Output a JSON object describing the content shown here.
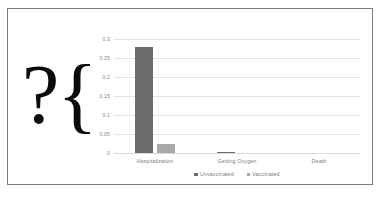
{
  "slide": {
    "glyph": "?{",
    "border_color": "#7c7c7c",
    "background": "#ffffff"
  },
  "chart_data": {
    "type": "bar",
    "title": "",
    "xlabel": "",
    "ylabel": "",
    "categories": [
      "Hospitalization",
      "Getting Oxygen",
      "Death"
    ],
    "series": [
      {
        "name": "Unvaccinated",
        "color": "#6b6b6b",
        "values": [
          0.28,
          0.003,
          0.0
        ]
      },
      {
        "name": "Vaccinated",
        "color": "#a8a8a8",
        "values": [
          0.025,
          0.0,
          0.0
        ]
      }
    ],
    "ylim": [
      0,
      0.3
    ],
    "yticks": [
      0,
      0.05,
      0.1,
      0.15,
      0.2,
      0.25,
      0.3
    ],
    "ytick_labels": [
      "0",
      "0.05",
      "0.1",
      "0.15",
      "0.2",
      "0.25",
      "0.3"
    ],
    "grid": true,
    "legend_position": "bottom",
    "axis_label_color": "#7d7d7d",
    "gridline_color": "#e4e4e4"
  }
}
